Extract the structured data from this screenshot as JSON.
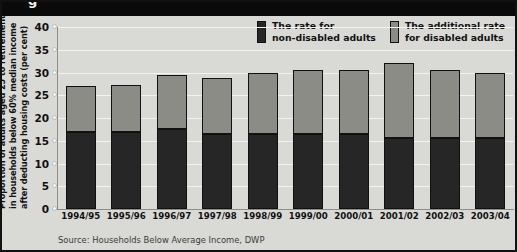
{
  "figure": {
    "cut_off_title": "g",
    "source_note": "Source: Households Below Average Income, DWP"
  },
  "legend": {
    "position": "top-right",
    "items": [
      {
        "label_line1": "The rate for",
        "label_line2": "non-disabled adults",
        "swatch": "dark-swatch",
        "color": "#262626"
      },
      {
        "label_line1": "The additional rate",
        "label_line2": "for disabled adults",
        "swatch": "grey-swatch",
        "color": "#8c8c87"
      }
    ]
  },
  "yaxis_title": {
    "line1": "Proportion of adults aged 25 to retirement",
    "line2": "in households below 60% median income",
    "line3": "after deducting housing costs (per cent)"
  },
  "chart_data": {
    "type": "bar",
    "stacked": true,
    "title": "",
    "subtitle": "",
    "xlabel": "",
    "ylabel": "Proportion of adults aged 25 to retirement in households below 60% median income after deducting housing costs (per cent)",
    "ylim": [
      0,
      40
    ],
    "yticks": [
      0,
      5,
      10,
      15,
      20,
      25,
      30,
      35,
      40
    ],
    "ytick_labels": [
      "0",
      "5",
      "10",
      "15",
      "20",
      "25",
      "30",
      "35",
      "40"
    ],
    "grid": true,
    "grid_axis": "y",
    "legend_position": "top-right",
    "categories": [
      "1994/95",
      "1995/96",
      "1996/97",
      "1997/98",
      "1998/99",
      "1999/00",
      "2000/01",
      "2001/02",
      "2002/03",
      "2003/04"
    ],
    "series": [
      {
        "name": "The rate for non-disabled adults",
        "color": "#262626",
        "values": [
          17,
          17,
          17.5,
          16.5,
          16.5,
          16.5,
          16.5,
          15.5,
          15.5,
          15.5
        ]
      },
      {
        "name": "The additional rate for disabled adults",
        "color": "#8c8c87",
        "values": [
          10,
          10.2,
          12,
          12.2,
          13.5,
          14,
          14,
          16.5,
          15,
          14.5
        ]
      }
    ],
    "totals": [
      27,
      27.2,
      29.5,
      28.7,
      30,
      30.5,
      30.5,
      32,
      30.5,
      30
    ]
  }
}
